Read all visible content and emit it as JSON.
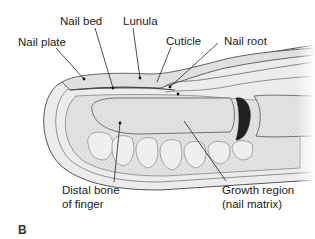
{
  "figure": {
    "panel_label": "B",
    "labels": {
      "nail_plate": "Nail plate",
      "nail_bed": "Nail bed",
      "lunula": "Lunula",
      "cuticle": "Cuticle",
      "nail_root": "Nail root",
      "distal_bone_line1": "Distal bone",
      "distal_bone_line2": "of finger",
      "growth_region_line1": "Growth region",
      "growth_region_line2": "(nail matrix)"
    }
  }
}
